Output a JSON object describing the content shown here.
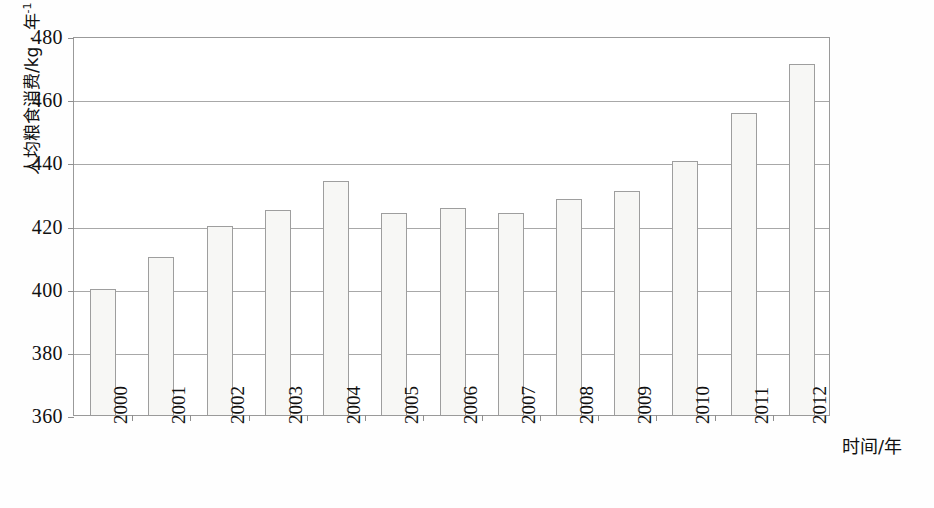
{
  "chart_data": {
    "type": "bar",
    "title": "",
    "subtitle": "",
    "xlabel": "时间/年",
    "ylabel": "人均粮食消费/kg · 年⁻¹",
    "ylabel_parts": {
      "base": "人均粮食消费/kg · 年",
      "superscript": "-1"
    },
    "categories": [
      "2000",
      "2001",
      "2002",
      "2003",
      "2004",
      "2005",
      "2006",
      "2007",
      "2008",
      "2009",
      "2010",
      "2011",
      "2012"
    ],
    "values": [
      400,
      410,
      420,
      425,
      434,
      424,
      425.5,
      424,
      428.5,
      431,
      440.5,
      455.5,
      471
    ],
    "ylim": [
      360,
      480
    ],
    "ytick_labels": [
      "480",
      "460",
      "440",
      "420",
      "400",
      "380",
      "360"
    ],
    "ytick_values": [
      480,
      460,
      440,
      420,
      400,
      380,
      360
    ],
    "ytick_step": 20,
    "grid": true,
    "grid_axis": "y",
    "legend": null,
    "legend_position": "none",
    "series": [
      {
        "name": "人均粮食消费",
        "values": [
          400,
          410,
          420,
          425,
          434,
          424,
          425.5,
          424,
          428.5,
          431,
          440.5,
          455.5,
          471
        ]
      }
    ]
  },
  "style": {
    "bar_fill": "#f7f7f5",
    "bar_border": "#9e9e9e",
    "grid_color": "#a8a8a8",
    "frame_color": "#9a9a9a",
    "text_color": "#111111",
    "background": "#fefefe"
  }
}
